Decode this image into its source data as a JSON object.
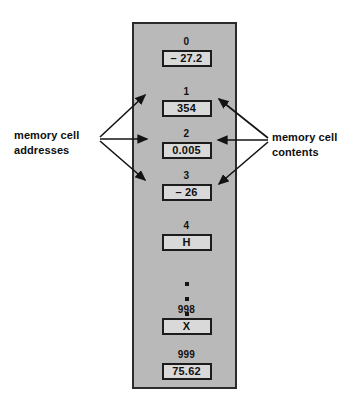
{
  "diagram": {
    "panel": {
      "fill_color": "#b9b9b9",
      "border_color": "#2b2b2b"
    },
    "cell_fill_color": "#d9d9d9",
    "cells": [
      {
        "address": "0",
        "contents": "– 27.2"
      },
      {
        "address": "1",
        "contents": "354"
      },
      {
        "address": "2",
        "contents": "0.005"
      },
      {
        "address": "3",
        "contents": "– 26"
      },
      {
        "address": "4",
        "contents": "H"
      },
      {
        "address": "998",
        "contents": "X"
      },
      {
        "address": "999",
        "contents": "75.62"
      }
    ],
    "ellipsis": "• • •",
    "labels": {
      "addresses_line1": "memory cell",
      "addresses_line2": "addresses",
      "contents_line1": "memory cell",
      "contents_line2": "contents"
    }
  }
}
